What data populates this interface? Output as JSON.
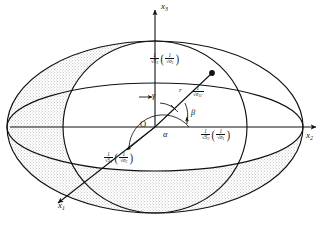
{
  "figure": {
    "type": "3d-ellipsoid-diagram",
    "background_color": "#ffffff",
    "line_color": "#111111",
    "shade_color": "#d8d8d8"
  },
  "axes": {
    "x1": {
      "label": "x",
      "sub": "1",
      "direction": "lower-left"
    },
    "x2": {
      "label": "x",
      "sub": "2",
      "direction": "right"
    },
    "x3": {
      "label": "x",
      "sub": "3",
      "direction": "up"
    },
    "origin": "O"
  },
  "angles": {
    "alpha": "α",
    "beta": "β",
    "gamma": "γ"
  },
  "vector": {
    "name": "r",
    "label": "r",
    "tip_marker": "filled-dot"
  },
  "semi_axis_labels": {
    "x3": {
      "main_num": "1",
      "main_den": "√S",
      "main_den_sub": "3",
      "paren_num": "1",
      "paren_den": "√σ",
      "paren_den_sub": "3"
    },
    "x2": {
      "main_num": "1",
      "main_den": "√S",
      "main_den_sub": "2",
      "paren_num": "1",
      "paren_den": "√σ",
      "paren_den_sub": "1"
    },
    "x1": {
      "main_num": "1",
      "main_den": "√S",
      "main_den_sub": "1",
      "paren_num": "1",
      "paren_den": "√σ",
      "paren_den_sub": "2"
    },
    "r": {
      "main_num": "1",
      "main_den": "√σ",
      "main_den_sub": "11'"
    }
  }
}
